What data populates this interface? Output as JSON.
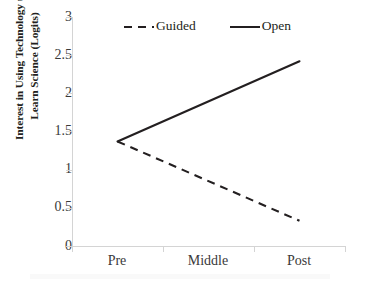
{
  "chart_data": {
    "type": "line",
    "title": "",
    "xlabel": "",
    "ylabel": "Interest in Using Technology to Learn Science (Logits)",
    "ylabel_lines": [
      "Interest in Using Technology to",
      "Learn Science (Logits)"
    ],
    "categories": [
      "Pre",
      "Middle",
      "Post"
    ],
    "x_tick_labels": [
      "Pre",
      "Middle",
      "Post"
    ],
    "y_tick_labels": [
      "3",
      "2.5",
      "2",
      "1.5",
      "1",
      "0.5",
      "0"
    ],
    "y_tick_values": [
      3,
      2.5,
      2,
      1.5,
      1,
      0.5,
      0
    ],
    "ylim": [
      0,
      3
    ],
    "grid": false,
    "legend_position": "top-center",
    "series": [
      {
        "name": "Guided",
        "style": "dashed",
        "color": "#231f20",
        "x": [
          "Pre",
          "Post"
        ],
        "values": [
          1.37,
          0.33
        ]
      },
      {
        "name": "Open",
        "style": "solid",
        "color": "#231f20",
        "x": [
          "Pre",
          "Post"
        ],
        "values": [
          1.37,
          2.42
        ]
      }
    ]
  },
  "legend": {
    "entries": [
      {
        "label": "Guided",
        "swatch": "dashed-line-sample"
      },
      {
        "label": "Open",
        "swatch": "solid-line-sample"
      }
    ]
  },
  "axes": {
    "y_title_line1": "Interest in Using Technology to",
    "y_title_line2": "Learn Science (Logits)",
    "y_ticks": [
      "3",
      "2.5",
      "2",
      "1.5",
      "1",
      "0.5",
      "0"
    ],
    "x_ticks": [
      "Pre",
      "Middle",
      "Post"
    ]
  },
  "colors": {
    "line": "#231f20",
    "axis": "#d4d4d4",
    "text": "#231f20",
    "tick_text": "#3a3a3a",
    "background": "#ffffff"
  }
}
